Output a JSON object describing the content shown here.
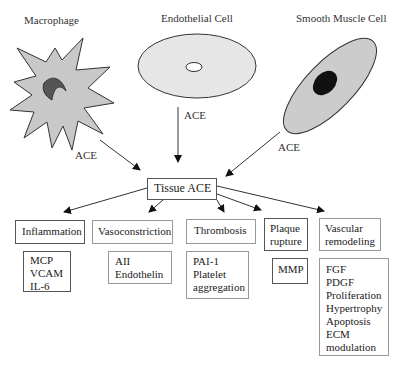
{
  "cells": {
    "macrophage": {
      "label": "Macrophage",
      "fill": "#c8c8c8",
      "nucleus_fill": "#555555"
    },
    "endothelial": {
      "label": "Endothelial Cell",
      "fill": "#e6e6e6"
    },
    "smooth_muscle": {
      "label": "Smooth Muscle Cell",
      "fill": "#cccccc",
      "nucleus_fill": "#111111"
    }
  },
  "arrow_labels": {
    "macrophage": "ACE",
    "endothelial": "ACE",
    "smooth_muscle": "ACE"
  },
  "hub": {
    "label": "Tissue ACE"
  },
  "effects": [
    {
      "title": "Inflammation",
      "details": [
        "MCP",
        "VCAM",
        "IL-6"
      ]
    },
    {
      "title": "Vasoconstriction",
      "details": [
        "AII",
        "Endothelin"
      ]
    },
    {
      "title": "Thrombosis",
      "details": [
        "PAI-1",
        "Platelet",
        "aggregation"
      ]
    },
    {
      "title_lines": [
        "Plaque",
        "rupture"
      ],
      "details": [
        "MMP"
      ]
    },
    {
      "title_lines": [
        "Vascular",
        "remodeling"
      ],
      "details": [
        "FGF",
        "PDGF",
        "Proliferation",
        "Hypertrophy",
        "Apoptosis",
        "ECM",
        "modulation"
      ]
    }
  ]
}
